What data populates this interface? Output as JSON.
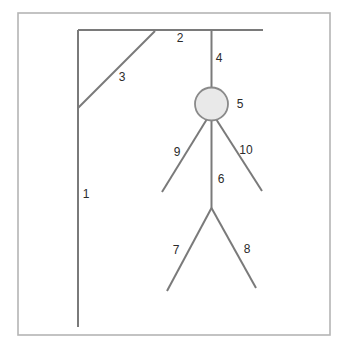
{
  "figure": {
    "background_color": "#ffffff",
    "frame": {
      "name": "diagram-border",
      "x": 18,
      "y": 13,
      "width": 312,
      "height": 322,
      "stroke_color": "#b5b5b5"
    },
    "stroke_color": "#7a7a7a",
    "label_color": "#2b2b2b",
    "head": {
      "cx": 211.5,
      "cy": 104,
      "r": 16.5,
      "fill_color": "#e9e9e9",
      "stroke_color": "#8a8a8a"
    },
    "parts": [
      {
        "id": "post",
        "label": "1",
        "label_x": 86,
        "label_y": 195,
        "x1": 78,
        "y1": 30,
        "x2": 78,
        "y2": 327
      },
      {
        "id": "beam",
        "label": "2",
        "label_x": 180,
        "label_y": 39,
        "x1": 78,
        "y1": 30,
        "x2": 263,
        "y2": 30
      },
      {
        "id": "brace",
        "label": "3",
        "label_x": 122,
        "label_y": 78,
        "x1": 78,
        "y1": 108,
        "x2": 155,
        "y2": 31
      },
      {
        "id": "rope",
        "label": "4",
        "label_x": 219,
        "label_y": 59,
        "x1": 211.5,
        "y1": 30,
        "x2": 211.5,
        "y2": 88
      },
      {
        "id": "head",
        "label": "5",
        "label_x": 240,
        "label_y": 105
      },
      {
        "id": "torso",
        "label": "6",
        "label_x": 221,
        "label_y": 180,
        "x1": 211.5,
        "y1": 120,
        "x2": 211.5,
        "y2": 208
      },
      {
        "id": "left-leg",
        "label": "7",
        "label_x": 176,
        "label_y": 251,
        "x1": 211.5,
        "y1": 208,
        "x2": 167,
        "y2": 291
      },
      {
        "id": "right-leg",
        "label": "8",
        "label_x": 247,
        "label_y": 250,
        "x1": 211.5,
        "y1": 208,
        "x2": 256,
        "y2": 288
      },
      {
        "id": "left-arm",
        "label": "9",
        "label_x": 177,
        "label_y": 153,
        "x1": 207,
        "y1": 119,
        "x2": 162,
        "y2": 192
      },
      {
        "id": "right-arm",
        "label": "10",
        "label_x": 246,
        "label_y": 151,
        "x1": 216,
        "y1": 119,
        "x2": 262,
        "y2": 191
      }
    ]
  }
}
